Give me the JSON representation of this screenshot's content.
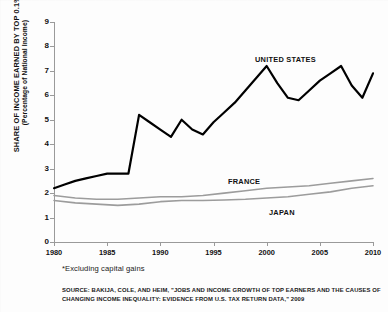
{
  "chart_data": {
    "type": "line",
    "title": "",
    "xlabel": "",
    "ylabel": "SHARE OF INCOME EARNED BY TOP 0.1%*",
    "ylabel_sub": "(Percentage of National Income)",
    "xlim": [
      1980,
      2010
    ],
    "ylim": [
      0,
      9
    ],
    "ytick_values": [
      0,
      1,
      2,
      3,
      4,
      5,
      6,
      7,
      8,
      9
    ],
    "ytick_labels": [
      "0",
      "1",
      "2",
      "3",
      "4",
      "5",
      "6",
      "7",
      "8",
      "9"
    ],
    "xtick_values": [
      1980,
      1985,
      1990,
      1995,
      2000,
      2005,
      2010
    ],
    "xtick_labels": [
      "1980",
      "1985",
      "1990",
      "1995",
      "2000",
      "2005",
      "2010"
    ],
    "grid": false,
    "legend_position": "inline-annotations",
    "series": [
      {
        "name": "UNITED STATES",
        "color": "#000000",
        "width": 2.2,
        "label_text": "UNITED STATES",
        "x": [
          1980,
          1981,
          1982,
          1983,
          1984,
          1985,
          1986,
          1987,
          1988,
          1989,
          1990,
          1991,
          1992,
          1993,
          1994,
          1995,
          1996,
          1997,
          1998,
          1999,
          2000,
          2001,
          2002,
          2003,
          2004,
          2005,
          2006,
          2007,
          2008,
          2009,
          2010
        ],
        "values": [
          2.2,
          2.35,
          2.5,
          2.6,
          2.7,
          2.8,
          2.8,
          2.8,
          5.2,
          4.9,
          4.6,
          4.3,
          5.0,
          4.6,
          4.4,
          4.9,
          5.3,
          5.7,
          6.2,
          6.7,
          7.2,
          6.5,
          5.9,
          5.8,
          6.2,
          6.6,
          6.9,
          7.2,
          6.4,
          5.9,
          6.9
        ]
      },
      {
        "name": "FRANCE",
        "color": "#9c9c9c",
        "width": 1.6,
        "label_text": "FRANCE",
        "x": [
          1980,
          1982,
          1984,
          1986,
          1988,
          1990,
          1992,
          1994,
          1996,
          1998,
          2000,
          2002,
          2004,
          2006,
          2008,
          2010
        ],
        "values": [
          1.9,
          1.8,
          1.75,
          1.75,
          1.8,
          1.85,
          1.85,
          1.9,
          2.0,
          2.1,
          2.2,
          2.25,
          2.3,
          2.4,
          2.5,
          2.6
        ]
      },
      {
        "name": "JAPAN",
        "color": "#9c9c9c",
        "width": 1.6,
        "label_text": "JAPAN",
        "x": [
          1980,
          1982,
          1984,
          1986,
          1988,
          1990,
          1992,
          1994,
          1996,
          1998,
          2000,
          2002,
          2004,
          2006,
          2008,
          2010
        ],
        "values": [
          1.7,
          1.6,
          1.55,
          1.5,
          1.55,
          1.65,
          1.7,
          1.7,
          1.72,
          1.75,
          1.8,
          1.85,
          1.95,
          2.05,
          2.2,
          2.3
        ]
      }
    ],
    "annotations": [
      {
        "text": "*Excluding capital gains"
      },
      {
        "text": "SOURCE: BAKIJA, COLE, AND HEIM, \"JOBS AND INCOME GROWTH OF TOP EARNERS AND THE CAUSES OF CHANGING INCOME INEQUALITY: EVIDENCE FROM U.S. TAX RETURN DATA,\" 2009"
      }
    ]
  },
  "footnote": "*Excluding capital gains",
  "source": "SOURCE: BAKIJA, COLE, AND HEIM, \"JOBS AND INCOME GROWTH OF TOP EARNERS AND THE CAUSES OF CHANGING INCOME INEQUALITY: EVIDENCE FROM U.S. TAX RETURN DATA,\" 2009"
}
